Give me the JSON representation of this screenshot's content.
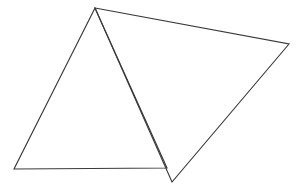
{
  "figure": {
    "background_color": "#ffffff",
    "stroke_color": "#3a3a3a",
    "stroke_width": 1.15,
    "canvas": {
      "width": 298,
      "height": 190
    },
    "shapes": [
      {
        "name": "left-triangle",
        "type": "triangle",
        "fill": "none",
        "points": "95,8 14,169 167,168",
        "vertices": [
          {
            "label": "apex",
            "x": 95,
            "y": 8
          },
          {
            "label": "bottom-left",
            "x": 14,
            "y": 169
          },
          {
            "label": "bottom-right",
            "x": 167,
            "y": 168
          }
        ]
      },
      {
        "name": "right-triangle",
        "type": "triangle",
        "fill": "none",
        "points": "95,8 289,44 172,182",
        "vertices": [
          {
            "label": "apex",
            "x": 95,
            "y": 8
          },
          {
            "label": "right",
            "x": 289,
            "y": 44
          },
          {
            "label": "bottom",
            "x": 172,
            "y": 182
          }
        ]
      }
    ]
  }
}
